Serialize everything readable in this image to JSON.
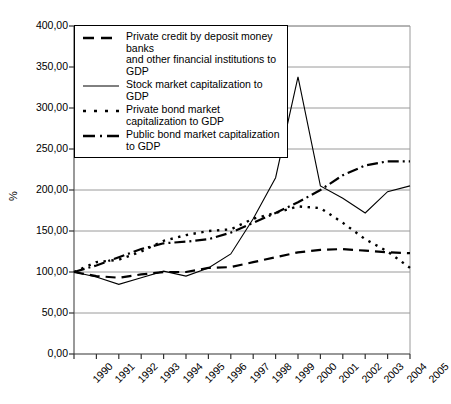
{
  "chart_data": {
    "type": "line",
    "title": "",
    "xlabel": "",
    "ylabel": "%",
    "x": [
      "1990",
      "1991",
      "1992",
      "1993",
      "1994",
      "1995",
      "1996",
      "1997",
      "1998",
      "1999",
      "2000",
      "2001",
      "2002",
      "2003",
      "2004",
      "2005"
    ],
    "xlim": [
      1990,
      2005
    ],
    "ylim": [
      0,
      400
    ],
    "yticks": [
      "0,00",
      "50,00",
      "100,00",
      "150,00",
      "200,00",
      "250,00",
      "300,00",
      "350,00",
      "400,00"
    ],
    "ytick_values": [
      0,
      50,
      100,
      150,
      200,
      250,
      300,
      350,
      400
    ],
    "grid": "horizontal",
    "legend_position": "top-left-inside",
    "series": [
      {
        "name": "Private credit by deposit money banks and other financial institutions to GDP",
        "style": "dashed",
        "values": [
          100,
          95,
          93,
          97,
          100,
          100,
          105,
          106,
          112,
          118,
          124,
          127,
          128,
          126,
          124,
          123
        ]
      },
      {
        "name": "Stock market capitalization to GDP",
        "style": "solid",
        "values": [
          100,
          94,
          85,
          93,
          101,
          95,
          105,
          122,
          165,
          215,
          338,
          205,
          190,
          172,
          198,
          205
        ]
      },
      {
        "name": "Private bond market capitalization to GDP",
        "style": "dotted",
        "values": [
          100,
          112,
          115,
          125,
          138,
          145,
          150,
          152,
          165,
          172,
          180,
          178,
          160,
          140,
          125,
          105
        ]
      },
      {
        "name": "Public bond market capitalization to GDP",
        "style": "dash-dot",
        "values": [
          100,
          108,
          118,
          128,
          135,
          137,
          140,
          148,
          160,
          172,
          185,
          200,
          218,
          230,
          235,
          235
        ]
      }
    ]
  },
  "legend": {
    "items": [
      {
        "line1": "Private credit by deposit money banks",
        "line2": "and other financial institutions to GDP",
        "swatch": "dashed-line-swatch"
      },
      {
        "line1": "Stock market capitalization to GDP",
        "line2": "",
        "swatch": "solid-line-swatch"
      },
      {
        "line1": "Private bond market capitalization to GDP",
        "line2": "",
        "swatch": "dotted-line-swatch"
      },
      {
        "line1": "Public bond market capitalization to GDP",
        "line2": "",
        "swatch": "dash-dot-line-swatch"
      }
    ]
  }
}
